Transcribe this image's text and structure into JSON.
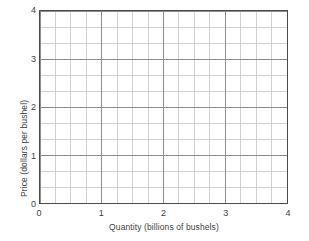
{
  "chart_data": {
    "type": "line",
    "title": "",
    "subtitle": "",
    "xlabel": "Quantity (billions of bushels)",
    "ylabel": "Price (dollars per bushel)",
    "xlim": [
      0,
      4
    ],
    "ylim": [
      0,
      4
    ],
    "xticks": [
      "0",
      "1",
      "2",
      "3",
      "4"
    ],
    "yticks": [
      "0",
      "1",
      "2",
      "3",
      "4"
    ],
    "xtick_values": [
      0,
      1,
      2,
      3,
      4
    ],
    "ytick_values": [
      0,
      1,
      2,
      3,
      4
    ],
    "grid": true,
    "grid_minor_x_per_unit": 4,
    "grid_minor_y_per_unit": 3,
    "grid_columns_total": 16,
    "grid_rows_total": 12,
    "legend": null,
    "legend_position": "none",
    "series": [],
    "annotations": [],
    "note": "Empty graph paper style plot with no plotted data series",
    "colors": {
      "background": "#ffffff",
      "frame": "#4a4a4a",
      "grid_major": "#8d8d8d",
      "grid_minor": "#c2c2c2",
      "text": "#3f3f3f"
    }
  }
}
